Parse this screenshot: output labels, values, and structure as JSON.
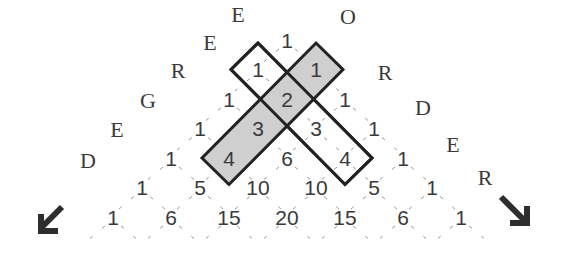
{
  "diagram": {
    "left_axis_label": [
      "E",
      "E",
      "R",
      "G",
      "E",
      "D"
    ],
    "left_axis_word": "DEGREE",
    "right_axis_label": [
      "O",
      "R",
      "D",
      "E",
      "R"
    ],
    "right_axis_word": "ORDER",
    "rows": [
      [
        "1"
      ],
      [
        "1",
        "1"
      ],
      [
        "1",
        "2",
        "1"
      ],
      [
        "1",
        "3",
        "3",
        "1"
      ],
      [
        "1",
        "4",
        "6",
        "4",
        "1"
      ],
      [
        "1",
        "5",
        "10",
        "10",
        "5",
        "1"
      ],
      [
        "1",
        "6",
        "15",
        "20",
        "15",
        "6",
        "1"
      ]
    ],
    "highlighted_bands": [
      {
        "name": "shaded-band",
        "fill": "#cfcfcf",
        "cells": [
          [
            1,
            1
          ],
          [
            2,
            1
          ],
          [
            3,
            1
          ],
          [
            4,
            1
          ]
        ],
        "values": [
          "1",
          "2",
          "3",
          "4"
        ]
      },
      {
        "name": "outlined-band",
        "fill": "none",
        "cells": [
          [
            1,
            0
          ],
          [
            2,
            1
          ],
          [
            3,
            2
          ],
          [
            4,
            3
          ]
        ],
        "values": [
          "1",
          "2",
          "3",
          "4"
        ]
      }
    ],
    "arrows": [
      {
        "name": "degree-arrow",
        "direction": "down-left"
      },
      {
        "name": "order-arrow",
        "direction": "down-right"
      }
    ],
    "colors": {
      "text": "#3a3a3a",
      "band_fill": "#cfcfcf",
      "band_stroke": "#222222",
      "grid": "#9a9a9a"
    }
  }
}
